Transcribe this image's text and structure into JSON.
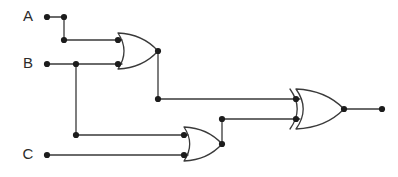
{
  "diagram": {
    "type": "logic-circuit-schematic",
    "width": 398,
    "height": 177,
    "background_color": "#ffffff",
    "wire_color": "#3a3a3a",
    "node_color": "#1c1c1c",
    "label_color": "#2b2b2b",
    "expression": "(A OR B) XOR (B OR C)"
  },
  "inputs": [
    {
      "id": "A",
      "label": "A",
      "label_x": 28,
      "label_y": 17,
      "terminal_x": 47,
      "terminal_y": 17
    },
    {
      "id": "B",
      "label": "B",
      "label_x": 28,
      "label_y": 64,
      "terminal_x": 47,
      "terminal_y": 64
    },
    {
      "id": "C",
      "label": "C",
      "label_x": 28,
      "label_y": 155,
      "terminal_x": 47,
      "terminal_y": 155
    }
  ],
  "outputs": [
    {
      "id": "OUT",
      "label": "",
      "terminal_x": 382,
      "terminal_y": 109
    }
  ],
  "gates": [
    {
      "id": "or1",
      "kind": "OR",
      "name": "or-gate-1",
      "x": 118,
      "y": 51,
      "width": 40,
      "height": 36,
      "input_pins": [
        {
          "x": 118,
          "y": 40
        },
        {
          "x": 118,
          "y": 64
        }
      ],
      "output_pin": {
        "x": 158,
        "y": 51
      }
    },
    {
      "id": "or2",
      "kind": "OR",
      "name": "or-gate-2",
      "x": 184,
      "y": 144,
      "width": 38,
      "height": 34,
      "input_pins": [
        {
          "x": 184,
          "y": 135
        },
        {
          "x": 184,
          "y": 155
        }
      ],
      "output_pin": {
        "x": 222,
        "y": 144
      }
    },
    {
      "id": "xor1",
      "kind": "XOR",
      "name": "xor-gate-1",
      "x": 296,
      "y": 109,
      "width": 48,
      "height": 40,
      "input_pins": [
        {
          "x": 296,
          "y": 99
        },
        {
          "x": 296,
          "y": 119
        }
      ],
      "output_pin": {
        "x": 344,
        "y": 109
      }
    }
  ],
  "wires": [
    {
      "id": "w-a-1",
      "name": "wire-input-a-to-or1",
      "points": "47,17 64,17 64,40 118,40"
    },
    {
      "id": "w-b-1",
      "name": "wire-input-b-to-or1",
      "points": "47,64 118,64"
    },
    {
      "id": "w-b-branch",
      "name": "wire-input-b-branch-to-or2",
      "points": "76,64 76,135 184,135"
    },
    {
      "id": "w-c-1",
      "name": "wire-input-c-to-or2",
      "points": "47,155 184,155"
    },
    {
      "id": "w-or1-xor",
      "name": "wire-or1-output-to-xor-top",
      "points": "158,51 158,99 296,99"
    },
    {
      "id": "w-or2-xor",
      "name": "wire-or2-output-to-xor-bottom",
      "points": "222,144 222,119 296,119"
    },
    {
      "id": "w-xor-out",
      "name": "wire-xor-output-to-terminal",
      "points": "344,109 382,109"
    }
  ],
  "junction_dots": [
    {
      "id": "d-a-term",
      "name": "dot-input-a-terminal",
      "x": 47,
      "y": 17
    },
    {
      "id": "d-a-corner",
      "name": "dot-input-a-corner",
      "x": 64,
      "y": 17
    },
    {
      "id": "d-a-elbow",
      "name": "dot-input-a-elbow",
      "x": 64,
      "y": 40
    },
    {
      "id": "d-b-term",
      "name": "dot-input-b-terminal",
      "x": 47,
      "y": 64
    },
    {
      "id": "d-b-junction",
      "name": "dot-input-b-junction",
      "x": 76,
      "y": 64
    },
    {
      "id": "d-b-branch-elbow",
      "name": "dot-input-b-branch-elbow",
      "x": 76,
      "y": 135
    },
    {
      "id": "d-c-term",
      "name": "dot-input-c-terminal",
      "x": 47,
      "y": 155
    },
    {
      "id": "d-or1-in1",
      "name": "dot-or1-input-top",
      "x": 118,
      "y": 40
    },
    {
      "id": "d-or1-in2",
      "name": "dot-or1-input-bottom",
      "x": 118,
      "y": 64
    },
    {
      "id": "d-or1-out",
      "name": "dot-or1-output",
      "x": 158,
      "y": 51
    },
    {
      "id": "d-or1-elbow",
      "name": "dot-or1-output-elbow",
      "x": 158,
      "y": 99
    },
    {
      "id": "d-or2-in1",
      "name": "dot-or2-input-top",
      "x": 184,
      "y": 135
    },
    {
      "id": "d-or2-in2",
      "name": "dot-or2-input-bottom",
      "x": 184,
      "y": 155
    },
    {
      "id": "d-or2-out",
      "name": "dot-or2-output",
      "x": 222,
      "y": 144
    },
    {
      "id": "d-or2-elbow",
      "name": "dot-or2-output-elbow",
      "x": 222,
      "y": 119
    },
    {
      "id": "d-xor-in1",
      "name": "dot-xor-input-top",
      "x": 296,
      "y": 99
    },
    {
      "id": "d-xor-in2",
      "name": "dot-xor-input-bottom",
      "x": 296,
      "y": 119
    },
    {
      "id": "d-xor-out",
      "name": "dot-xor-output",
      "x": 344,
      "y": 109
    },
    {
      "id": "d-out-term",
      "name": "dot-output-terminal",
      "x": 382,
      "y": 109
    }
  ]
}
